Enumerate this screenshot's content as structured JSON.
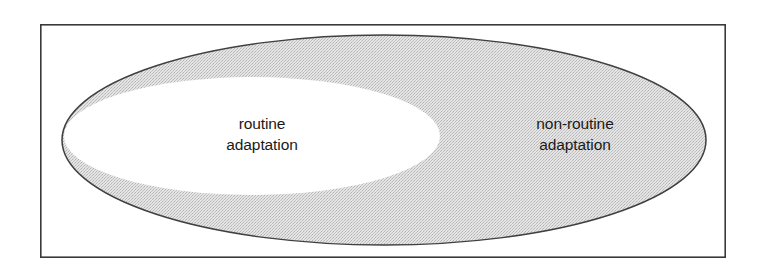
{
  "figure": {
    "kind": "nested-ellipse-diagram",
    "background_color": "#ffffff",
    "frame": {
      "name": "outer-rectangle-border",
      "stroke_color": "#3a3a3a",
      "stroke_width": 1.6,
      "x": 40,
      "y": 24,
      "width": 686,
      "height": 234
    },
    "outer_region": {
      "label_line1": "non-routine",
      "label_line2": "adaptation",
      "fill_color": "#d2d2d2",
      "stroke_color": "#3f3f3f",
      "center_x": 384,
      "center_y": 140,
      "radius_x": 322,
      "radius_y": 105
    },
    "inner_region": {
      "label_line1": "routine",
      "label_line2": "adaptation",
      "fill_color": "#ffffff",
      "center_x": 252,
      "center_y": 136,
      "radius_x": 188,
      "radius_y": 59
    },
    "labels": {
      "routine": {
        "line1": "routine",
        "line2": "adaptation"
      },
      "non_routine": {
        "line1": "non-routine",
        "line2": "adaptation"
      }
    },
    "text_color": "#1a1a1a"
  }
}
